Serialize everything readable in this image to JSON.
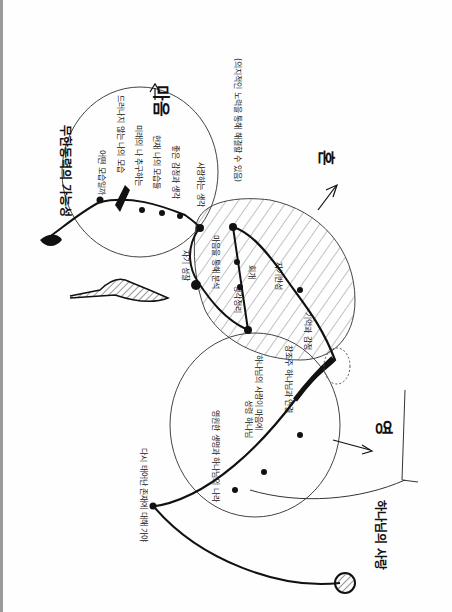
{
  "diagram": {
    "orientation": "rotated 90 degrees, hand-drawn sketch",
    "main_labels": {
      "top_circle": "마음",
      "hatched_circle": "혼",
      "lower_circle": "영",
      "top_left_title": "무한동력의 가능성",
      "bottom_right_title": "하나님의 사랑",
      "bottom_left_note": "다시 태어난 존재에 대해 가야",
      "tree_label": "자기 성찰"
    },
    "top_circle_notes": [
      "어떤 모습일까",
      "드러나지 않는 나의 모습",
      "미래의 나 추구하는",
      "현재 나의 모습들",
      "좋은 감정과 생각",
      "사랑하는 생각"
    ],
    "hatched_circle_notes": [
      "(의지적인 노력을 통해 해결할 수 있음)",
      "마음을 통해 분석",
      "회개",
      "생각정리",
      "자기반성",
      "기억과 감정"
    ],
    "lower_circle_notes": [
      "창조주 하나님과 연결",
      "하나님의 사랑이 마음에",
      "성령 하나님",
      "영원한 생명과 하나님의 나라"
    ],
    "colors": {
      "ink": "#111111",
      "paper": "#fefefe",
      "border": "#9a9a9a"
    }
  }
}
